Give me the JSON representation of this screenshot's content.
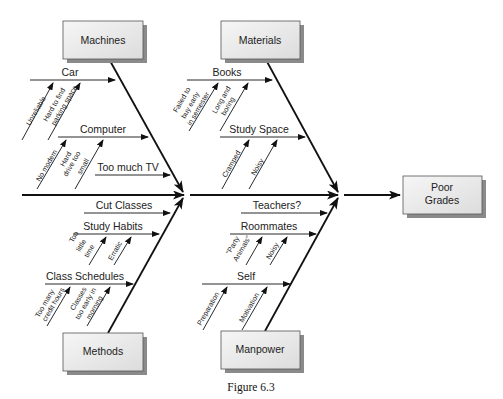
{
  "figure": {
    "caption": "Figure 6.3",
    "effect": {
      "label_line1": "Poor",
      "label_line2": "Grades"
    },
    "categories": {
      "machines": "Machines",
      "materials": "Materials",
      "methods": "Methods",
      "manpower": "Manpower"
    },
    "causes": {
      "car": "Car",
      "car_sub1": "Unreliable",
      "car_sub2_l1": "Hard to find",
      "car_sub2_l2": "parking space",
      "computer": "Computer",
      "computer_sub1": "No modem",
      "computer_sub2_l1": "Hard",
      "computer_sub2_l2": "drive too",
      "computer_sub2_l3": "small",
      "tv": "Too much TV",
      "cut_classes": "Cut Classes",
      "study_habits": "Study Habits",
      "study_sub1_l1": "Too",
      "study_sub1_l2": "little",
      "study_sub1_l3": "time",
      "study_sub2": "Erratic",
      "class_schedules": "Class Schedules",
      "sched_sub1_l1": "Too many",
      "sched_sub1_l2": "credit hours",
      "sched_sub2_l1": "Classes",
      "sched_sub2_l2": "too early in",
      "sched_sub2_l3": "morning",
      "books": "Books",
      "books_sub1_l1": "Failed to",
      "books_sub1_l2": "buy early",
      "books_sub1_l3": "in semester",
      "books_sub2_l1": "Long and",
      "books_sub2_l2": "boring",
      "study_space": "Study Space",
      "space_sub1": "Cramped",
      "space_sub2": "Noisy",
      "teachers": "Teachers?",
      "roommates": "Roommates",
      "room_sub1_l1": "\"Party",
      "room_sub1_l2": "Animals\"",
      "room_sub2": "Noisy",
      "self": "Self",
      "self_sub1": "Preparation",
      "self_sub2": "Motivation"
    }
  }
}
